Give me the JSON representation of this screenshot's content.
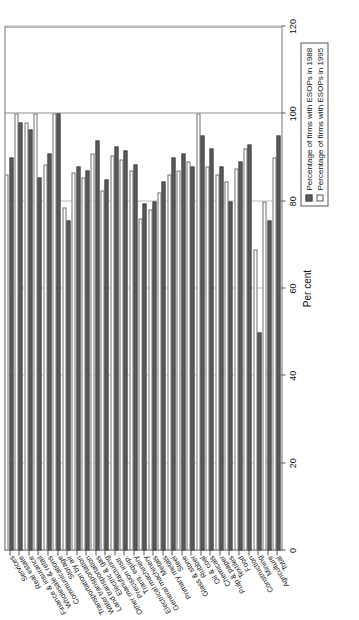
{
  "chart_data": {
    "type": "bar",
    "orientation": "horizontal",
    "title": "",
    "xlabel": "Per cent",
    "ylabel": "",
    "xlim": [
      0,
      120
    ],
    "xticks": [
      0,
      20,
      40,
      60,
      80,
      100,
      120
    ],
    "xticklabels": [
      "0",
      "20",
      "40",
      "60",
      "80",
      "100",
      "120"
    ],
    "grid": true,
    "legend_position": "bottom-right",
    "categories": [
      "Total",
      "Agriculture",
      "Mining",
      "Construction",
      "Food",
      "Textiles",
      "Pulp & paper",
      "Chemicals",
      "Oil & coal",
      "Rubber",
      "Glass & stone",
      "Steel",
      "Primary metals",
      "Metals",
      "General machinery",
      "Electrical machinery",
      "Trans. equip.",
      "Precision instr.",
      "Other manufacturing",
      "Electric & gas",
      "Land transportation",
      "Water transportation",
      "Transportation by air",
      "Storage",
      "Communications",
      "Wholesale & retail",
      "Finance & insurance",
      "Real estate",
      "Services"
    ],
    "series": [
      {
        "name": "Percentage of firms with ESOPs in 1988",
        "key": "s1988",
        "color": "#5b5b5b",
        "values": [
          95.0,
          75.5,
          50.0,
          93.0,
          89.0,
          80.0,
          88.0,
          92.0,
          95.0,
          88.0,
          91.0,
          90.0,
          84.5,
          80.0,
          79.5,
          88.5,
          91.5,
          92.5,
          85.0,
          94.0,
          87.0,
          88.0,
          75.5,
          100.0,
          91.0,
          85.5,
          96.5,
          98.0,
          90.0
        ]
      },
      {
        "name": "Percentage of firms with ESOPs in 1995",
        "key": "s1995",
        "color": "#ffffff",
        "values": [
          90.0,
          80.0,
          69.0,
          92.0,
          87.5,
          84.5,
          86.0,
          88.0,
          100.0,
          89.0,
          87.0,
          86.0,
          82.0,
          78.0,
          76.0,
          87.0,
          89.5,
          90.5,
          82.5,
          91.0,
          85.5,
          86.5,
          78.5,
          100.0,
          88.5,
          100.0,
          98.0,
          100.0,
          86.0
        ]
      }
    ]
  },
  "legend": {
    "items": [
      {
        "label": "Percentage of firms with ESOPs in 1988",
        "key": "s1988"
      },
      {
        "label": "Percentage of firms with ESOPs in 1995",
        "key": "s1995"
      }
    ]
  }
}
